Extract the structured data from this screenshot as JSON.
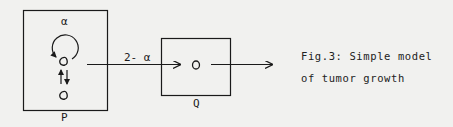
{
  "diagram": {
    "compartment_p": {
      "label": "P",
      "self_loop_label": "α",
      "exchange_arrows": "↑↓"
    },
    "compartment_q": {
      "label": "Q"
    },
    "transfer_arrow": {
      "label": "2- α"
    },
    "caption": {
      "line1": "Fig.3: Simple model",
      "line2": "of tumor growth"
    }
  }
}
